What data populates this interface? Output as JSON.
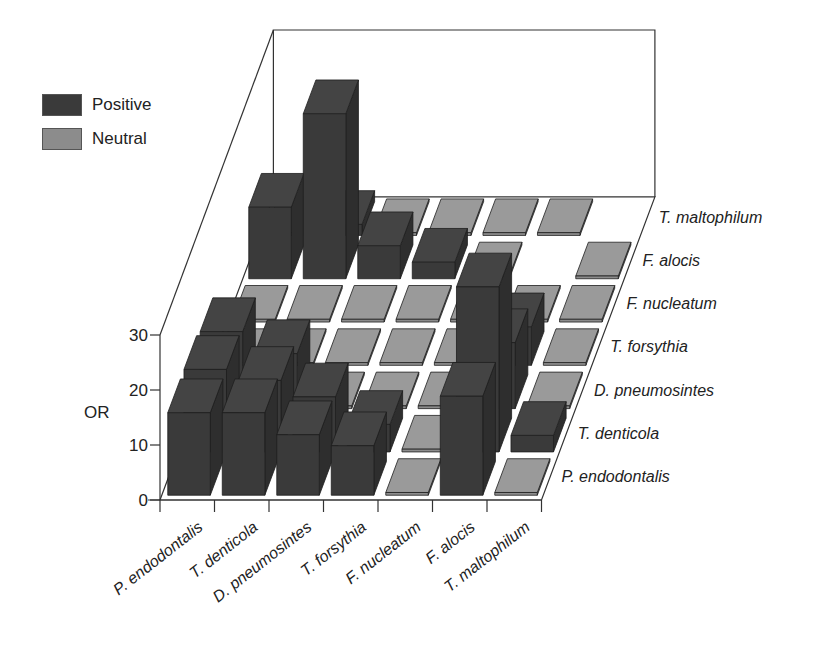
{
  "chart_data": {
    "type": "bar3d",
    "title": "",
    "ylabel": "OR",
    "ylim": [
      0,
      30
    ],
    "yticks": [
      0,
      10,
      20,
      30
    ],
    "x_categories": [
      "P. endodontalis",
      "T. denticola",
      "D. pneumosintes",
      "T. forsythia",
      "F. nucleatum",
      "F. alocis",
      "T. maltophilum"
    ],
    "depth_categories": [
      "P. endodontalis",
      "T. denticola",
      "D. pneumosintes",
      "T. forsythia",
      "F. nucleatum",
      "F. alocis",
      "T. maltophilum"
    ],
    "legend": [
      {
        "label": "Positive",
        "color": "#3a3a3a"
      },
      {
        "label": "Neutral",
        "color": "#8c8c8c"
      }
    ],
    "legend_position": "top-left",
    "grid": false,
    "cells": [
      {
        "x": "P. endodontalis",
        "row": "P. endodontalis",
        "type": "Positive",
        "value": 15
      },
      {
        "x": "T. denticola",
        "row": "P. endodontalis",
        "type": "Positive",
        "value": 15
      },
      {
        "x": "D. pneumosintes",
        "row": "P. endodontalis",
        "type": "Positive",
        "value": 11
      },
      {
        "x": "T. forsythia",
        "row": "P. endodontalis",
        "type": "Positive",
        "value": 9
      },
      {
        "x": "F. nucleatum",
        "row": "P. endodontalis",
        "type": "Neutral",
        "value": 1
      },
      {
        "x": "F. alocis",
        "row": "P. endodontalis",
        "type": "Positive",
        "value": 18
      },
      {
        "x": "T. maltophilum",
        "row": "P. endodontalis",
        "type": "Neutral",
        "value": 1
      },
      {
        "x": "P. endodontalis",
        "row": "T. denticola",
        "type": "Positive",
        "value": 15
      },
      {
        "x": "T. denticola",
        "row": "T. denticola",
        "type": "Positive",
        "value": 13
      },
      {
        "x": "D. pneumosintes",
        "row": "T. denticola",
        "type": "Positive",
        "value": 10
      },
      {
        "x": "T. forsythia",
        "row": "T. denticola",
        "type": "Positive",
        "value": 5
      },
      {
        "x": "F. nucleatum",
        "row": "T. denticola",
        "type": "Neutral",
        "value": 1
      },
      {
        "x": "F. alocis",
        "row": "T. denticola",
        "type": "Positive",
        "value": 30
      },
      {
        "x": "T. maltophilum",
        "row": "T. denticola",
        "type": "Positive",
        "value": 3
      },
      {
        "x": "P. endodontalis",
        "row": "D. pneumosintes",
        "type": "Positive",
        "value": 14
      },
      {
        "x": "T. denticola",
        "row": "D. pneumosintes",
        "type": "Positive",
        "value": 10
      },
      {
        "x": "D. pneumosintes",
        "row": "D. pneumosintes",
        "type": "Neutral",
        "value": 1
      },
      {
        "x": "T. forsythia",
        "row": "D. pneumosintes",
        "type": "Neutral",
        "value": 1
      },
      {
        "x": "F. nucleatum",
        "row": "D. pneumosintes",
        "type": "Neutral",
        "value": 1
      },
      {
        "x": "F. alocis",
        "row": "D. pneumosintes",
        "type": "Positive",
        "value": 12
      },
      {
        "x": "T. maltophilum",
        "row": "D. pneumosintes",
        "type": "Neutral",
        "value": 1
      },
      {
        "x": "P. endodontalis",
        "row": "T. forsythia",
        "type": "Neutral",
        "value": 1
      },
      {
        "x": "T. denticola",
        "row": "T. forsythia",
        "type": "Neutral",
        "value": 1
      },
      {
        "x": "D. pneumosintes",
        "row": "T. forsythia",
        "type": "Neutral",
        "value": 1
      },
      {
        "x": "T. forsythia",
        "row": "T. forsythia",
        "type": "Neutral",
        "value": 1
      },
      {
        "x": "F. nucleatum",
        "row": "T. forsythia",
        "type": "Neutral",
        "value": 1
      },
      {
        "x": "F. alocis",
        "row": "T. forsythia",
        "type": "Positive",
        "value": 7
      },
      {
        "x": "T. maltophilum",
        "row": "T. forsythia",
        "type": "Neutral",
        "value": 1
      },
      {
        "x": "P. endodontalis",
        "row": "F. nucleatum",
        "type": "Neutral",
        "value": 1
      },
      {
        "x": "T. denticola",
        "row": "F. nucleatum",
        "type": "Neutral",
        "value": 1
      },
      {
        "x": "D. pneumosintes",
        "row": "F. nucleatum",
        "type": "Neutral",
        "value": 1
      },
      {
        "x": "T. forsythia",
        "row": "F. nucleatum",
        "type": "Neutral",
        "value": 1
      },
      {
        "x": "F. nucleatum",
        "row": "F. nucleatum",
        "type": "Neutral",
        "value": 1
      },
      {
        "x": "F. alocis",
        "row": "F. nucleatum",
        "type": "Neutral",
        "value": 1
      },
      {
        "x": "T. maltophilum",
        "row": "F. nucleatum",
        "type": "Neutral",
        "value": 1
      },
      {
        "x": "P. endodontalis",
        "row": "F. alocis",
        "type": "Positive",
        "value": 13
      },
      {
        "x": "T. denticola",
        "row": "F. alocis",
        "type": "Positive",
        "value": 30
      },
      {
        "x": "D. pneumosintes",
        "row": "F. alocis",
        "type": "Positive",
        "value": 6
      },
      {
        "x": "T. forsythia",
        "row": "F. alocis",
        "type": "Positive",
        "value": 3
      },
      {
        "x": "F. nucleatum",
        "row": "F. alocis",
        "type": "Neutral",
        "value": 1
      },
      {
        "x": "T. maltophilum",
        "row": "F. alocis",
        "type": "Neutral",
        "value": 1
      },
      {
        "x": "P. endodontalis",
        "row": "T. maltophilum",
        "type": "Neutral",
        "value": 1
      },
      {
        "x": "T. denticola",
        "row": "T. maltophilum",
        "type": "Positive",
        "value": 2
      },
      {
        "x": "D. pneumosintes",
        "row": "T. maltophilum",
        "type": "Neutral",
        "value": 1
      },
      {
        "x": "T. forsythia",
        "row": "T. maltophilum",
        "type": "Neutral",
        "value": 1
      },
      {
        "x": "F. nucleatum",
        "row": "T. maltophilum",
        "type": "Neutral",
        "value": 1
      },
      {
        "x": "F. alocis",
        "row": "T. maltophilum",
        "type": "Neutral",
        "value": 1
      }
    ]
  },
  "legend": {
    "positive_label": "Positive",
    "neutral_label": "Neutral"
  },
  "axes": {
    "ylabel": "OR",
    "yticks": [
      "0",
      "10",
      "20",
      "30"
    ],
    "x_labels": [
      "P. endodontalis",
      "T. denticola",
      "D. pneumosintes",
      "T. forsythia",
      "F. nucleatum",
      "F. alocis",
      "T. maltophilum"
    ],
    "row_labels": [
      "P. endodontalis",
      "T. denticola",
      "D. pneumosintes",
      "T. forsythia",
      "F. nucleatum",
      "F. alocis",
      "T. maltophilum"
    ]
  },
  "colors": {
    "positive": "#3a3a3a",
    "positive_side": "#2e2e2e",
    "positive_top": "#444444",
    "neutral": "#8c8c8c",
    "neutral_top": "#9a9a9a",
    "neutral_side": "#7a7a7a",
    "line": "#333333"
  }
}
